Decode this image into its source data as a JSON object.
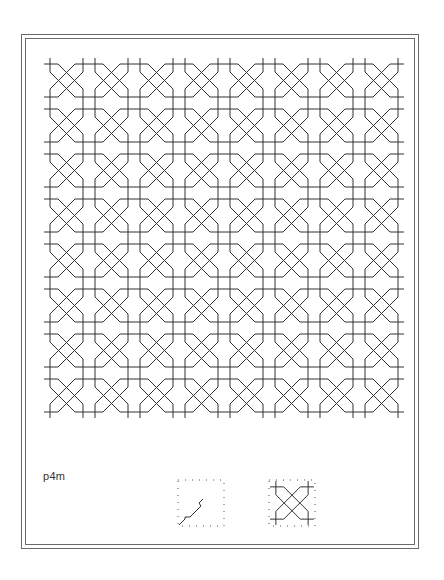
{
  "figure": {
    "label": "p4m",
    "pattern": {
      "columns": 8,
      "rows": 8,
      "cell_size": 45,
      "origin": [
        44,
        58
      ],
      "stroke_color": "#333333"
    },
    "legend": {
      "fundamental_region": "fundamental-region-diagram",
      "unit_cell": "unit-cell-diagram"
    }
  }
}
